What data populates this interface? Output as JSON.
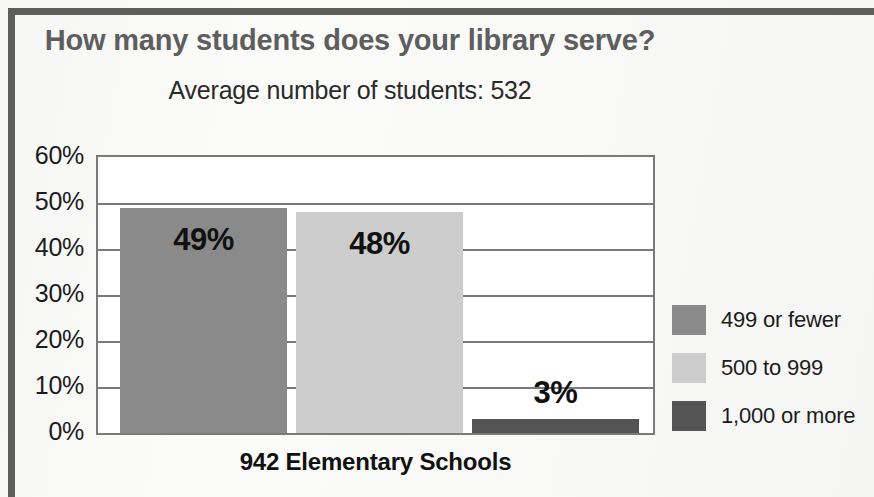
{
  "chart_data": {
    "type": "bar",
    "title": "How many students does your library serve?",
    "subtitle": "Average number of students: 532",
    "xlabel": "942 Elementary Schools",
    "ylabel": "",
    "ylim": [
      0,
      60
    ],
    "grid": true,
    "legend_position": "right",
    "categories": [
      "499 or fewer",
      "500 to 999",
      "1,000 or more"
    ],
    "values": [
      49,
      48,
      3
    ],
    "value_labels": [
      "49%",
      "48%",
      "3%"
    ],
    "colors": [
      "#8a8a8a",
      "#cdcdcd",
      "#545454"
    ],
    "ytick_labels": [
      "60%",
      "50%",
      "40%",
      "30%",
      "20%",
      "10%",
      "0%"
    ],
    "ytick_values": [
      60,
      50,
      40,
      30,
      20,
      10,
      0
    ]
  },
  "legend": {
    "items": [
      {
        "label": "499 or fewer",
        "color": "#8a8a8a"
      },
      {
        "label": "500 to 999",
        "color": "#cdcdcd"
      },
      {
        "label": "1,000 or more",
        "color": "#545454"
      }
    ]
  },
  "style": {
    "title_color": "#5e5e5e",
    "axis_color": "#7a7a7a",
    "text_color": "#1c1c1c",
    "background": "#fbfbf9"
  }
}
